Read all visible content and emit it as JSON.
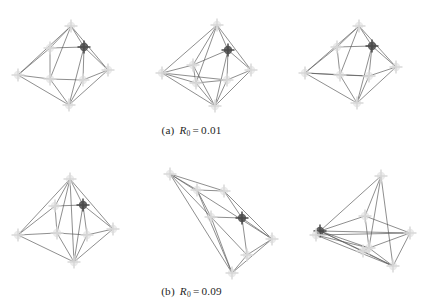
{
  "figure": {
    "background_color": "#ffffff",
    "edge_color": "#5a5a5a",
    "node_color": "#d9d9d9",
    "node_dark_color": "#4a4a4a",
    "node_marker": "plus-cross-marker",
    "rows": [
      {
        "id": "row-a",
        "caption": {
          "label": "(a)",
          "symbol": "R",
          "subscript": "0",
          "equals": "=",
          "value": "0.01",
          "full_text": "(a)  R0 = 0.01"
        },
        "panels": [
          {
            "name": "panel-a-1",
            "title": "",
            "width": 125,
            "height": 100,
            "nodes": [
              {
                "id": "n0",
                "x": 62,
                "y": 13,
                "shade": "light"
              },
              {
                "id": "n1",
                "x": 41,
                "y": 35,
                "shade": "light"
              },
              {
                "id": "n2",
                "x": 75,
                "y": 34,
                "shade": "dark"
              },
              {
                "id": "n3",
                "x": 9,
                "y": 62,
                "shade": "light"
              },
              {
                "id": "n4",
                "x": 99,
                "y": 57,
                "shade": "light"
              },
              {
                "id": "n5",
                "x": 41,
                "y": 66,
                "shade": "light"
              },
              {
                "id": "n6",
                "x": 74,
                "y": 67,
                "shade": "light"
              },
              {
                "id": "n7",
                "x": 60,
                "y": 92,
                "shade": "light"
              }
            ],
            "edges": [
              [
                0,
                1
              ],
              [
                0,
                2
              ],
              [
                0,
                3
              ],
              [
                0,
                4
              ],
              [
                1,
                2
              ],
              [
                1,
                5
              ],
              [
                1,
                3
              ],
              [
                2,
                6
              ],
              [
                2,
                4
              ],
              [
                3,
                5
              ],
              [
                3,
                7
              ],
              [
                4,
                6
              ],
              [
                4,
                7
              ],
              [
                5,
                6
              ],
              [
                5,
                7
              ],
              [
                6,
                7
              ],
              [
                0,
                5
              ],
              [
                2,
                7
              ]
            ]
          },
          {
            "name": "panel-a-2",
            "title": "",
            "width": 125,
            "height": 100,
            "nodes": [
              {
                "id": "n0",
                "x": 65,
                "y": 12,
                "shade": "light"
              },
              {
                "id": "n1",
                "x": 41,
                "y": 52,
                "shade": "light"
              },
              {
                "id": "n2",
                "x": 76,
                "y": 37,
                "shade": "dark"
              },
              {
                "id": "n3",
                "x": 10,
                "y": 60,
                "shade": "light"
              },
              {
                "id": "n4",
                "x": 99,
                "y": 57,
                "shade": "light"
              },
              {
                "id": "n5",
                "x": 44,
                "y": 70,
                "shade": "light"
              },
              {
                "id": "n6",
                "x": 75,
                "y": 67,
                "shade": "light"
              },
              {
                "id": "n7",
                "x": 63,
                "y": 93,
                "shade": "light"
              }
            ],
            "edges": [
              [
                0,
                1
              ],
              [
                0,
                2
              ],
              [
                0,
                3
              ],
              [
                0,
                4
              ],
              [
                1,
                2
              ],
              [
                1,
                5
              ],
              [
                1,
                3
              ],
              [
                2,
                6
              ],
              [
                2,
                4
              ],
              [
                3,
                5
              ],
              [
                3,
                7
              ],
              [
                4,
                6
              ],
              [
                4,
                7
              ],
              [
                5,
                6
              ],
              [
                5,
                7
              ],
              [
                6,
                7
              ],
              [
                0,
                5
              ],
              [
                2,
                7
              ],
              [
                1,
                7
              ],
              [
                3,
                6
              ]
            ]
          },
          {
            "name": "panel-a-3",
            "title": "",
            "width": 125,
            "height": 100,
            "nodes": [
              {
                "id": "n0",
                "x": 64,
                "y": 13,
                "shade": "light"
              },
              {
                "id": "n1",
                "x": 42,
                "y": 34,
                "shade": "light"
              },
              {
                "id": "n2",
                "x": 77,
                "y": 33,
                "shade": "dark"
              },
              {
                "id": "n3",
                "x": 10,
                "y": 60,
                "shade": "light"
              },
              {
                "id": "n4",
                "x": 101,
                "y": 54,
                "shade": "light"
              },
              {
                "id": "n5",
                "x": 45,
                "y": 62,
                "shade": "light"
              },
              {
                "id": "n6",
                "x": 74,
                "y": 63,
                "shade": "light"
              },
              {
                "id": "n7",
                "x": 62,
                "y": 90,
                "shade": "light"
              }
            ],
            "edges": [
              [
                0,
                1
              ],
              [
                0,
                2
              ],
              [
                0,
                3
              ],
              [
                0,
                4
              ],
              [
                1,
                2
              ],
              [
                1,
                5
              ],
              [
                1,
                3
              ],
              [
                2,
                6
              ],
              [
                2,
                4
              ],
              [
                3,
                5
              ],
              [
                3,
                7
              ],
              [
                4,
                6
              ],
              [
                4,
                7
              ],
              [
                5,
                6
              ],
              [
                5,
                7
              ],
              [
                6,
                7
              ],
              [
                0,
                5
              ],
              [
                2,
                7
              ],
              [
                3,
                6
              ]
            ]
          }
        ]
      },
      {
        "id": "row-b",
        "caption": {
          "label": "(b)",
          "symbol": "R",
          "subscript": "0",
          "equals": "=",
          "value": "0.09",
          "full_text": "(b)  R0 = 0.09"
        },
        "panels": [
          {
            "name": "panel-b-1",
            "title": "",
            "width": 125,
            "height": 108,
            "nodes": [
              {
                "id": "n0",
                "x": 61,
                "y": 16,
                "shade": "light"
              },
              {
                "id": "n1",
                "x": 46,
                "y": 43,
                "shade": "light"
              },
              {
                "id": "n2",
                "x": 74,
                "y": 42,
                "shade": "dark"
              },
              {
                "id": "n3",
                "x": 9,
                "y": 72,
                "shade": "light"
              },
              {
                "id": "n4",
                "x": 104,
                "y": 66,
                "shade": "light"
              },
              {
                "id": "n5",
                "x": 48,
                "y": 70,
                "shade": "light"
              },
              {
                "id": "n6",
                "x": 78,
                "y": 72,
                "shade": "light"
              },
              {
                "id": "n7",
                "x": 65,
                "y": 99,
                "shade": "light"
              }
            ],
            "edges": [
              [
                0,
                1
              ],
              [
                0,
                2
              ],
              [
                0,
                3
              ],
              [
                0,
                4
              ],
              [
                1,
                2
              ],
              [
                1,
                5
              ],
              [
                1,
                3
              ],
              [
                2,
                6
              ],
              [
                2,
                4
              ],
              [
                3,
                5
              ],
              [
                3,
                7
              ],
              [
                4,
                6
              ],
              [
                4,
                7
              ],
              [
                5,
                6
              ],
              [
                5,
                7
              ],
              [
                6,
                7
              ],
              [
                0,
                5
              ],
              [
                2,
                7
              ],
              [
                0,
                7
              ]
            ]
          },
          {
            "name": "panel-b-2",
            "title": "",
            "width": 132,
            "height": 112,
            "nodes": [
              {
                "id": "n0",
                "x": 18,
                "y": 11,
                "shade": "light"
              },
              {
                "id": "n1",
                "x": 45,
                "y": 27,
                "shade": "light"
              },
              {
                "id": "n2",
                "x": 72,
                "y": 28,
                "shade": "light"
              },
              {
                "id": "n3",
                "x": 59,
                "y": 54,
                "shade": "light"
              },
              {
                "id": "n4",
                "x": 90,
                "y": 55,
                "shade": "dark"
              },
              {
                "id": "n5",
                "x": 120,
                "y": 76,
                "shade": "light"
              },
              {
                "id": "n6",
                "x": 95,
                "y": 92,
                "shade": "light"
              },
              {
                "id": "n7",
                "x": 80,
                "y": 110,
                "shade": "light"
              }
            ],
            "edges": [
              [
                0,
                1
              ],
              [
                0,
                3
              ],
              [
                0,
                7
              ],
              [
                0,
                5
              ],
              [
                1,
                2
              ],
              [
                1,
                3
              ],
              [
                1,
                7
              ],
              [
                2,
                4
              ],
              [
                2,
                5
              ],
              [
                3,
                4
              ],
              [
                3,
                7
              ],
              [
                3,
                6
              ],
              [
                4,
                6
              ],
              [
                4,
                5
              ],
              [
                5,
                6
              ],
              [
                5,
                7
              ],
              [
                6,
                7
              ],
              [
                0,
                2
              ]
            ]
          },
          {
            "name": "panel-b-3",
            "title": "",
            "width": 128,
            "height": 112,
            "nodes": [
              {
                "id": "n0",
                "x": 79,
                "y": 13,
                "shade": "light"
              },
              {
                "id": "n1",
                "x": 63,
                "y": 53,
                "shade": "light"
              },
              {
                "id": "n2",
                "x": 18,
                "y": 68,
                "shade": "dark"
              },
              {
                "id": "n3",
                "x": 14,
                "y": 72,
                "shade": "light"
              },
              {
                "id": "n4",
                "x": 108,
                "y": 70,
                "shade": "light"
              },
              {
                "id": "n5",
                "x": 67,
                "y": 85,
                "shade": "light"
              },
              {
                "id": "n6",
                "x": 91,
                "y": 103,
                "shade": "light"
              },
              {
                "id": "n7",
                "x": 61,
                "y": 88,
                "shade": "light"
              }
            ],
            "edges": [
              [
                0,
                1
              ],
              [
                0,
                2
              ],
              [
                0,
                5
              ],
              [
                0,
                6
              ],
              [
                1,
                2
              ],
              [
                1,
                4
              ],
              [
                1,
                5
              ],
              [
                2,
                3
              ],
              [
                2,
                4
              ],
              [
                2,
                5
              ],
              [
                2,
                7
              ],
              [
                3,
                5
              ],
              [
                3,
                6
              ],
              [
                3,
                4
              ],
              [
                4,
                6
              ],
              [
                4,
                5
              ],
              [
                5,
                6
              ],
              [
                5,
                7
              ],
              [
                6,
                7
              ],
              [
                2,
                6
              ]
            ]
          }
        ]
      }
    ]
  }
}
